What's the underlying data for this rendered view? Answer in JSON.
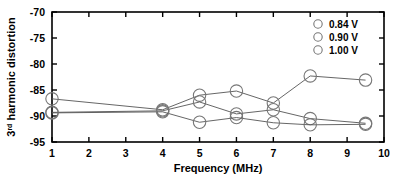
{
  "chart_data": {
    "type": "line",
    "title": "",
    "xlabel": "Frequency (MHz)",
    "ylabel": "3rd harmonic distortion",
    "ylabel_base": "3",
    "ylabel_sup": "rd",
    "ylabel_rest": " harmonic distortion",
    "xlim": [
      1,
      10
    ],
    "ylim": [
      -95,
      -70
    ],
    "xticks": [
      1,
      2,
      3,
      4,
      5,
      6,
      7,
      8,
      9,
      10
    ],
    "yticks": [
      -70,
      -75,
      -80,
      -85,
      -90,
      -95
    ],
    "xtick_labels": [
      "1",
      "2",
      "3",
      "4",
      "5",
      "6",
      "7",
      "8",
      "9",
      "10"
    ],
    "ytick_labels": [
      "-70",
      "-75",
      "-80",
      "-85",
      "-90",
      "-95"
    ],
    "grid": false,
    "legend_position": "top-right",
    "marker": "open-circle",
    "line_color": "#555555",
    "marker_color": "#777777",
    "axis_color": "#000000",
    "x": [
      1,
      4,
      5,
      6,
      7,
      8,
      9.5
    ],
    "series": [
      {
        "name": "0.84 V",
        "label": "0.84 V",
        "values": [
          -86.7,
          -88.8,
          -86.0,
          -85.2,
          -87.5,
          -82.3,
          -83.1
        ]
      },
      {
        "name": "0.90 V",
        "label": "0.90 V",
        "values": [
          -89.3,
          -89.0,
          -87.3,
          -89.6,
          -88.8,
          -90.5,
          -91.4
        ]
      },
      {
        "name": "1.00 V",
        "label": "1.00 V",
        "values": [
          -89.4,
          -89.2,
          -91.2,
          -90.3,
          -91.3,
          -91.7,
          -91.6
        ]
      }
    ]
  },
  "legend": {
    "entries": [
      {
        "label": "0.84 V"
      },
      {
        "label": "0.90 V"
      },
      {
        "label": "1.00 V"
      }
    ]
  }
}
